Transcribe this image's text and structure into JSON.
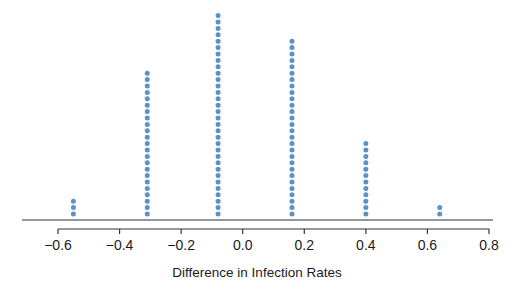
{
  "chart_data": {
    "type": "dot",
    "title": "",
    "xlabel": "Difference in Infection Rates",
    "ylabel": "",
    "xlim": [
      -0.6,
      0.8
    ],
    "xticks": [
      -0.6,
      -0.4,
      -0.2,
      0.0,
      0.2,
      0.4,
      0.6,
      0.8
    ],
    "xtick_labels": [
      "−0.6",
      "−0.4",
      "−0.2",
      "0.0",
      "0.2",
      "0.4",
      "0.6",
      "0.8"
    ],
    "grid": false,
    "legend": null,
    "points": [
      {
        "x": -0.55,
        "count": 3
      },
      {
        "x": -0.31,
        "count": 23
      },
      {
        "x": -0.08,
        "count": 32
      },
      {
        "x": 0.16,
        "count": 28
      },
      {
        "x": 0.4,
        "count": 12
      },
      {
        "x": 0.64,
        "count": 2
      }
    ],
    "total_points": 100,
    "dot_color": "#5b93c6"
  },
  "axis": {
    "title": "Difference in Infection Rates"
  }
}
